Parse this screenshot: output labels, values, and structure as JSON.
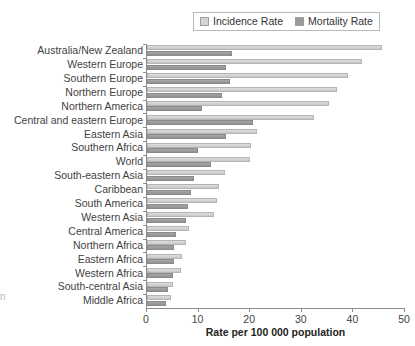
{
  "chart_data": {
    "type": "bar",
    "orientation": "horizontal",
    "title": "",
    "subtitle": "",
    "xlabel": "Rate per 100 000 population",
    "ylabel": "",
    "xlim": [
      0,
      50
    ],
    "xticks": [
      0,
      10,
      20,
      30,
      40,
      50
    ],
    "xtick_labels": [
      "0",
      "10",
      "20",
      "30",
      "40",
      "50"
    ],
    "grid": false,
    "legend_position": "top-right",
    "categories": [
      "Australia/New Zealand",
      "Western Europe",
      "Southern Europe",
      "Northern Europe",
      "Northern America",
      "Central and eastern Europe",
      "Eastern Asia",
      "Southern Africa",
      "World",
      "South-eastern Asia",
      "Caribbean",
      "South America",
      "Western Asia",
      "Central America",
      "Northern Africa",
      "Eastern Africa",
      "Western Africa",
      "South-central Asia",
      "Middle Africa"
    ],
    "series": [
      {
        "name": "Incidence Rate",
        "color": "#d4d4d4",
        "values": [
          45.6,
          41.7,
          38.9,
          36.9,
          35.3,
          32.3,
          21.3,
          20.2,
          20.0,
          15.2,
          14.0,
          13.6,
          12.9,
          8.1,
          7.5,
          6.8,
          6.5,
          5.1,
          4.6
        ]
      },
      {
        "name": "Mortality Rate",
        "color": "#9a9a9a",
        "values": [
          16.4,
          15.3,
          16.1,
          14.5,
          10.6,
          20.5,
          15.4,
          9.9,
          12.4,
          9.2,
          8.5,
          7.9,
          7.5,
          5.6,
          5.3,
          5.2,
          5.0,
          4.0,
          3.6
        ]
      }
    ]
  },
  "legend": {
    "entries": [
      {
        "label": "Incidence Rate",
        "swatch": "light-gray-swatch"
      },
      {
        "label": "Mortality Rate",
        "swatch": "dark-gray-swatch"
      }
    ]
  },
  "edge_artifact": {
    "text": "n"
  }
}
